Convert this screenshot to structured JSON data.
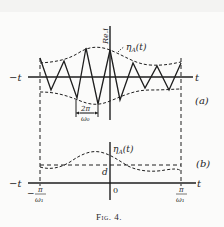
{
  "figure": {
    "caption": "Fig. 4.",
    "panel_a": {
      "label": "(a)",
      "x_axis_left": "−t",
      "x_axis_right": "t",
      "y_axis_label": "Re.i",
      "envelope_label_main": "η",
      "envelope_label_sub": "A",
      "envelope_label_arg": "(t)",
      "period_label_num": "2π",
      "period_label_den": "ω₀"
    },
    "panel_b": {
      "label": "(b)",
      "x_axis_left": "−t",
      "x_axis_right": "t",
      "curve_label_main": "η",
      "curve_label_sub": "A",
      "curve_label_arg": "(t)",
      "level_label": "d",
      "origin_label": "0",
      "left_tick_prefix": "−",
      "left_tick_num": "π",
      "left_tick_den": "ω₁",
      "right_tick_num": "π",
      "right_tick_den": "ω₁"
    }
  },
  "colors": {
    "ink": "#1e1e1e",
    "paper": "#fbfbfa"
  }
}
